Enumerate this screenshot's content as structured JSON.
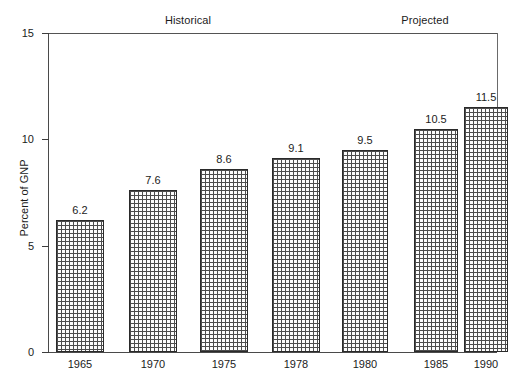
{
  "chart_data": {
    "type": "bar",
    "title": "",
    "xlabel": "",
    "ylabel": "Percent of GNP",
    "ylim": [
      0,
      15
    ],
    "yticks": [
      0,
      5,
      10,
      15
    ],
    "ytick_labels": [
      "0",
      "5",
      "10",
      "15"
    ],
    "grid": false,
    "legend": "none",
    "categories": [
      "1965",
      "1970",
      "1975",
      "1978",
      "1980",
      "1985",
      "1990"
    ],
    "values": [
      6.2,
      7.6,
      8.6,
      9.1,
      9.5,
      10.5,
      11.5
    ],
    "value_labels": [
      "6.2",
      "7.6",
      "8.6",
      "9.1",
      "9.5",
      "10.5",
      "11.5"
    ],
    "groups": [
      {
        "label": "Historical",
        "categories": [
          "1965",
          "1970",
          "1975",
          "1978"
        ]
      },
      {
        "label": "Projected",
        "categories": [
          "1980",
          "1985",
          "1990"
        ]
      }
    ],
    "annotations": [
      "Historical",
      "Projected"
    ]
  },
  "axes": {
    "y_label": "Percent of GNP",
    "y_ticks": [
      {
        "label": "15",
        "value": 15
      },
      {
        "label": "10",
        "value": 10
      },
      {
        "label": "5",
        "value": 5
      },
      {
        "label": "0",
        "value": 0
      }
    ]
  },
  "sections": [
    {
      "label": "Historical"
    },
    {
      "label": "Projected"
    }
  ],
  "bars": [
    {
      "year": "1965",
      "value": 6.2,
      "value_label": "6.2"
    },
    {
      "year": "1970",
      "value": 7.6,
      "value_label": "7.6"
    },
    {
      "year": "1975",
      "value": 8.6,
      "value_label": "8.6"
    },
    {
      "year": "1978",
      "value": 9.1,
      "value_label": "9.1"
    },
    {
      "year": "1980",
      "value": 9.5,
      "value_label": "9.5"
    },
    {
      "year": "1985",
      "value": 10.5,
      "value_label": "10.5"
    },
    {
      "year": "1990",
      "value": 11.5,
      "value_label": "11.5"
    }
  ],
  "colors": {
    "axis": "#4a4a4a",
    "bar_outline": "#2a2a2a",
    "bar_hatch": "#4d4d4d",
    "text": "#1b1b1b",
    "background": "#ffffff"
  }
}
